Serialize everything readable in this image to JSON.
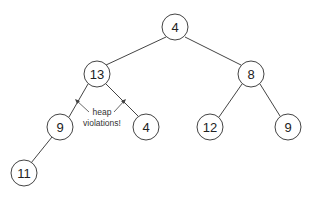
{
  "diagram": {
    "type": "binary-heap-tree",
    "nodes": [
      {
        "id": "n0",
        "value": "4",
        "x": 175,
        "y": 27
      },
      {
        "id": "n1",
        "value": "13",
        "x": 97,
        "y": 74
      },
      {
        "id": "n2",
        "value": "8",
        "x": 251,
        "y": 74
      },
      {
        "id": "n3",
        "value": "9",
        "x": 60,
        "y": 127
      },
      {
        "id": "n4",
        "value": "4",
        "x": 146,
        "y": 127
      },
      {
        "id": "n5",
        "value": "12",
        "x": 210,
        "y": 127
      },
      {
        "id": "n6",
        "value": "9",
        "x": 288,
        "y": 127
      },
      {
        "id": "n7",
        "value": "11",
        "x": 24,
        "y": 173
      }
    ],
    "edges": [
      [
        "n0",
        "n1"
      ],
      [
        "n0",
        "n2"
      ],
      [
        "n1",
        "n3"
      ],
      [
        "n1",
        "n4"
      ],
      [
        "n2",
        "n5"
      ],
      [
        "n2",
        "n6"
      ],
      [
        "n3",
        "n7"
      ]
    ],
    "annotation": {
      "line1": "heap",
      "line2": "violations!",
      "points_to": [
        [
          "n1",
          "n3"
        ],
        [
          "n1",
          "n4"
        ]
      ]
    },
    "colors": {
      "stroke": "#444444",
      "text": "#222222",
      "background": "#ffffff"
    }
  }
}
